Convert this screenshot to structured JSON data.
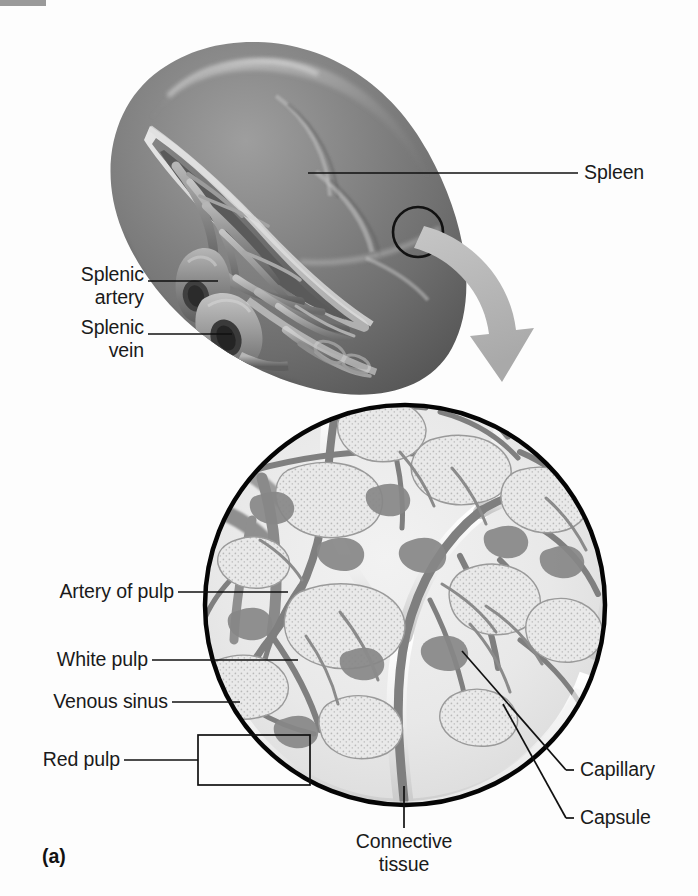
{
  "figure": {
    "panel_letter": "(a)",
    "title_organ": "Spleen"
  },
  "labels": {
    "spleen": "Spleen",
    "splenic_artery": "Splenic\nartery",
    "splenic_vein": "Splenic\nvein",
    "artery_of_pulp": "Artery of pulp",
    "white_pulp": "White pulp",
    "venous_sinus": "Venous sinus",
    "red_pulp": "Red pulp",
    "capillary": "Capillary",
    "capsule": "Capsule",
    "connective_tissue": "Connective\ntissue"
  },
  "colors": {
    "background": "#fdfdfd",
    "leader_line": "#111111",
    "organ_dark": "#5f5f5f",
    "organ_mid": "#7d7d7d",
    "organ_light": "#b9b9b9",
    "organ_highlight": "#d9d9d9",
    "vessel_gray": "#8a8a8a",
    "pulp_light": "#e6e6e6",
    "pulp_stipple": "#d2d2d2",
    "circle_outline": "#000000",
    "arrow_gray": "#b4b4b4",
    "top_bar": "#9a9a9a",
    "text": "#1a1a1a"
  },
  "geometry": {
    "magnifier_circle": {
      "cx": 405,
      "cy": 605,
      "r": 202
    },
    "callout_circle": {
      "cx": 418,
      "cy": 232,
      "r": 25
    },
    "red_pulp_bracket": {
      "x": 198,
      "y": 735,
      "w": 112,
      "h": 50
    }
  }
}
